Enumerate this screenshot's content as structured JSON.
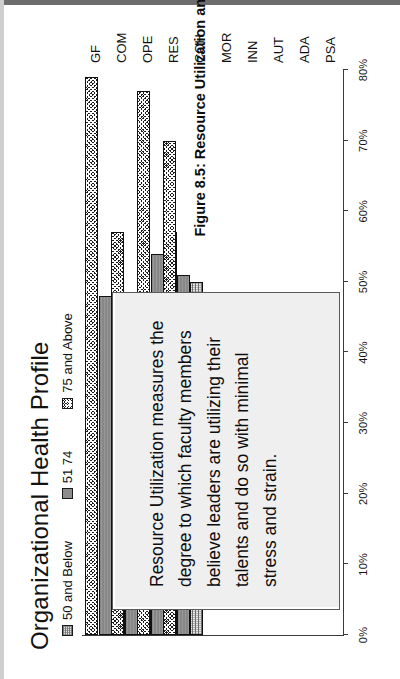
{
  "figure": {
    "caption": "Figure 8.5:  Resource Utilization and Student Performance"
  },
  "chart_data": {
    "type": "bar",
    "orientation": "horizontal-grouped",
    "title": "Organizational Health Profile",
    "xlabel": "",
    "ylabel": "",
    "categories": [
      "GF",
      "COM",
      "OPE",
      "RES",
      "COH",
      "MOR",
      "INN",
      "AUT",
      "ADA",
      "PSA"
    ],
    "value_axis_ticks": [
      "0%",
      "10%",
      "20%",
      "30%",
      "40%",
      "50%",
      "60%",
      "70%",
      "80%"
    ],
    "value_axis_range": [
      0,
      80
    ],
    "grid": false,
    "legend_position": "top-left",
    "series": [
      {
        "name": "50 and Below",
        "pattern": "light-dotted",
        "color": "#e6e6e6",
        "values": [
          41,
          44,
          57,
          50,
          null,
          null,
          null,
          null,
          null,
          null
        ]
      },
      {
        "name": "51 74",
        "pattern": "solid-gray",
        "color": "#878787",
        "values": [
          48,
          47,
          54,
          51,
          null,
          null,
          null,
          null,
          null,
          null
        ]
      },
      {
        "name": "75 and Above",
        "pattern": "dark-checker",
        "color": "#1c1c1c",
        "values": [
          79,
          57,
          77,
          70,
          null,
          null,
          null,
          null,
          null,
          null
        ]
      }
    ]
  },
  "callout": {
    "text": "Resource Utilization measures the degree to which faculty members believe leaders are utilizing their talents and do so with minimal stress and strain."
  }
}
